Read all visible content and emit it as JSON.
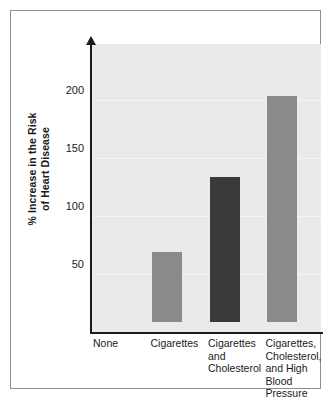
{
  "figure": {
    "background_color": "#ffffff",
    "frame_color": "#8c8e96",
    "plot_background_color": "#eaeaea",
    "axis_color": "#1a1a1a"
  },
  "axis": {
    "y_title_line1": "% Increase in the Risk",
    "y_title_line2": "of Heart Disease",
    "y_ticks": [
      "50",
      "100",
      "150",
      "200"
    ]
  },
  "chart_data": {
    "type": "bar",
    "title": "",
    "xlabel": "",
    "ylabel": "% Increase in the Risk of Heart Disease",
    "categories": [
      "None",
      "Cigarettes",
      "Cigarettes and Cholesterol",
      "Cigarettes, Cholesterol, and High Blood Pressure"
    ],
    "category_label_lines": [
      [
        "None"
      ],
      [
        "Cigarettes"
      ],
      [
        "Cigarettes",
        "and",
        "Cholesterol"
      ],
      [
        "Cigarettes,",
        "Cholesterol,",
        "and High",
        "Blood",
        "Pressure"
      ]
    ],
    "values": [
      0,
      60,
      125,
      195
    ],
    "bar_colors": [
      "#eaeaea",
      "#8a8a8a",
      "#3a3a3a",
      "#8a8a8a"
    ],
    "yticks": [
      50,
      100,
      150,
      200
    ],
    "ylim": [
      0,
      248
    ],
    "grid": true,
    "legend": "none"
  }
}
